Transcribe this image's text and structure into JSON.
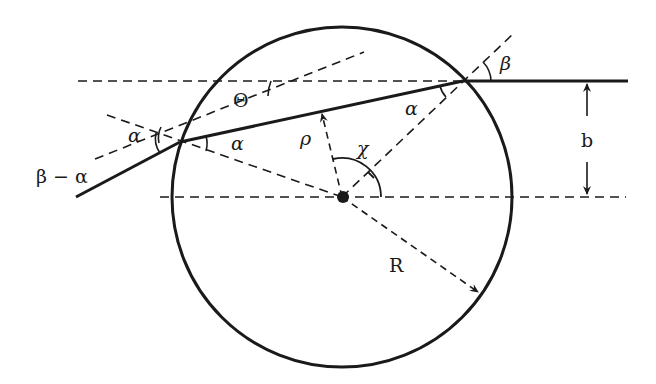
{
  "figure": {
    "colors": {
      "ink": "#1a1a1a",
      "background": "#ffffff"
    }
  },
  "labels": {
    "theta": "Θ",
    "beta": "β",
    "alpha_right": "α",
    "alpha_left_inner": "α",
    "alpha_left_outer": "α",
    "beta_minus_alpha": "β − α",
    "rho": "ρ",
    "chi": "χ",
    "impact_parameter": "b",
    "radius": "R"
  }
}
